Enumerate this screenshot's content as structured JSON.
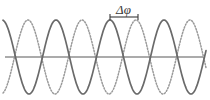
{
  "figure": {
    "background_color": "#ffffff",
    "width": 210,
    "height": 100
  },
  "axis": {
    "name": "horizontal-baseline",
    "color": "#8f8f8f",
    "y": 57,
    "x_start": 5,
    "x_end": 203,
    "stroke_width": 1.6
  },
  "annotation": {
    "label": "Δφ",
    "label_x": 116,
    "label_y": 3,
    "color": "#3a3a3a",
    "bracket": {
      "x_start": 110,
      "x_end": 138,
      "y": 17,
      "tick_height": 6,
      "color": "#3a3a3a",
      "stroke_width": 1.1
    }
  },
  "chart_data": {
    "type": "line",
    "xlabel": "",
    "ylabel": "",
    "xlim": [
      0,
      210
    ],
    "ylim": [
      -40,
      40
    ],
    "grid": false,
    "legend": "none",
    "baseline_y": 57,
    "amplitude_px": 37,
    "period_px": 54,
    "phase_shift_px": 28,
    "annotations": [
      {
        "text": "Δφ",
        "meaning": "phase difference",
        "from_x": 110,
        "to_x": 138
      }
    ],
    "series": [
      {
        "name": "wave-dotted",
        "style": "dotted",
        "color": "#9a9a9a",
        "stroke_width": 1.5,
        "dash_pattern": "1.3 1.7",
        "amplitude": 37,
        "period": 54,
        "phase_offset_px": 28,
        "peaks_x": [
          28,
          82,
          136,
          190
        ],
        "troughs_x": [
          55,
          109,
          163
        ],
        "zero_crossings_x": [
          14,
          41,
          68,
          95,
          122,
          149,
          176,
          203
        ]
      },
      {
        "name": "wave-solid",
        "style": "solid",
        "color": "#6a6a6a",
        "stroke_width": 1.7,
        "dash_pattern": "none",
        "amplitude": 37,
        "period": 54,
        "phase_offset_px": 0,
        "peaks_x": [
          56,
          110,
          164
        ],
        "troughs_x": [
          29,
          83,
          137,
          191
        ],
        "zero_crossings_x": [
          15,
          42,
          69,
          96,
          123,
          150,
          177,
          204
        ]
      }
    ]
  }
}
